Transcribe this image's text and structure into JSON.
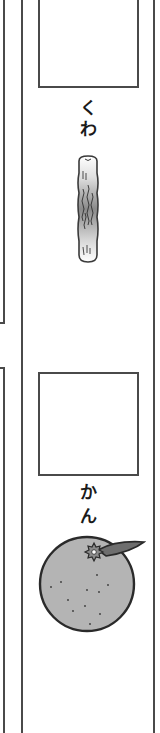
{
  "worksheet": {
    "cards": [
      {
        "word": "くわ",
        "chars": [
          "く",
          "わ"
        ],
        "illustration": "mulberry-branch-icon"
      },
      {
        "word": "かん",
        "chars": [
          "か",
          "ん"
        ],
        "illustration": "mandarin-orange-icon"
      }
    ]
  },
  "colors": {
    "line": "#4a4a4a",
    "text": "#1a1a1a",
    "orange_fill": "#b4b4b4",
    "leaf_fill": "#6e6e6e",
    "branch_mid": "#8a8a8a"
  }
}
